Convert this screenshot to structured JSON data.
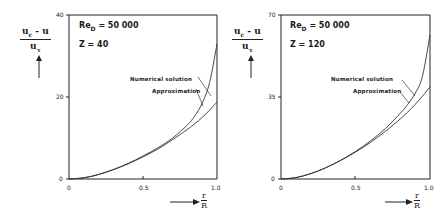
{
  "chart_data": [
    {
      "type": "line",
      "title": "",
      "annotations": [
        "Re_D = 50000",
        "Z = 40"
      ],
      "xlabel": "r/R",
      "ylabel": "(u_c - u) / u_τ",
      "xlim": [
        0,
        1.0
      ],
      "ylim": [
        0,
        40
      ],
      "x_ticks": [
        "0",
        "0.5",
        "1.0"
      ],
      "y_ticks": [
        "0",
        "20",
        "40"
      ],
      "grid": false,
      "legend": "inline labels with leader lines",
      "x": [
        0,
        0.1,
        0.2,
        0.3,
        0.4,
        0.5,
        0.6,
        0.7,
        0.8,
        0.85,
        0.9,
        0.95,
        1.0
      ],
      "series": [
        {
          "name": "Numerical solution",
          "values": [
            0,
            0.3,
            1.1,
            2.3,
            3.8,
            5.6,
            7.6,
            10.0,
            13.2,
            15.4,
            18.5,
            23.5,
            33.0
          ]
        },
        {
          "name": "Approximation",
          "values": [
            0,
            0.3,
            1.1,
            2.3,
            3.7,
            5.4,
            7.3,
            9.6,
            12.1,
            13.5,
            15.0,
            16.8,
            18.8
          ]
        }
      ]
    },
    {
      "type": "line",
      "title": "",
      "annotations": [
        "Re_D = 50000",
        "Z = 120"
      ],
      "xlabel": "r/R",
      "ylabel": "(u_c - u) / u_τ",
      "xlim": [
        0,
        1.0
      ],
      "ylim": [
        0,
        70
      ],
      "x_ticks": [
        "0",
        "0.5",
        "1.0"
      ],
      "y_ticks": [
        "0",
        "35",
        "70"
      ],
      "grid": false,
      "legend": "inline labels with leader lines",
      "x": [
        0,
        0.1,
        0.2,
        0.3,
        0.4,
        0.5,
        0.6,
        0.7,
        0.8,
        0.85,
        0.9,
        0.95,
        1.0
      ],
      "series": [
        {
          "name": "Numerical solution",
          "values": [
            0,
            0.6,
            2.3,
            4.8,
            8.0,
            11.8,
            16.2,
            21.5,
            28.0,
            31.8,
            36.5,
            44.0,
            61.5
          ]
        },
        {
          "name": "Approximation",
          "values": [
            0,
            0.6,
            2.3,
            4.8,
            7.9,
            11.5,
            15.6,
            20.3,
            25.6,
            28.5,
            31.8,
            35.4,
            39.3
          ]
        }
      ]
    }
  ],
  "panels": [
    {
      "ylabel_num": "u",
      "ylabel_num_sub": "c",
      "ylabel_num_rest": "- u",
      "ylabel_den": "u",
      "ylabel_den_sub": "τ",
      "re_label": "Re",
      "re_sub": "D",
      "re_value": "= 50 000",
      "z_label": "Z  = 40",
      "numerical_label": "Numerical solution",
      "approx_label": "Approximation",
      "x_ticks": [
        "0",
        "0.5",
        "1.0"
      ],
      "y_ticks": [
        "0",
        "20",
        "40"
      ],
      "xlabel_num": "r",
      "xlabel_den": "R"
    },
    {
      "ylabel_num": "u",
      "ylabel_num_sub": "c",
      "ylabel_num_rest": "- u",
      "ylabel_den": "u",
      "ylabel_den_sub": "τ",
      "re_label": "Re",
      "re_sub": "D",
      "re_value": "= 50 000",
      "z_label": "Z  = 120",
      "numerical_label": "Numerical solution",
      "approx_label": "Approximation",
      "x_ticks": [
        "0",
        "0.5",
        "1.0"
      ],
      "y_ticks": [
        "0",
        "35",
        "70"
      ],
      "xlabel_num": "r",
      "xlabel_den": "R"
    }
  ]
}
